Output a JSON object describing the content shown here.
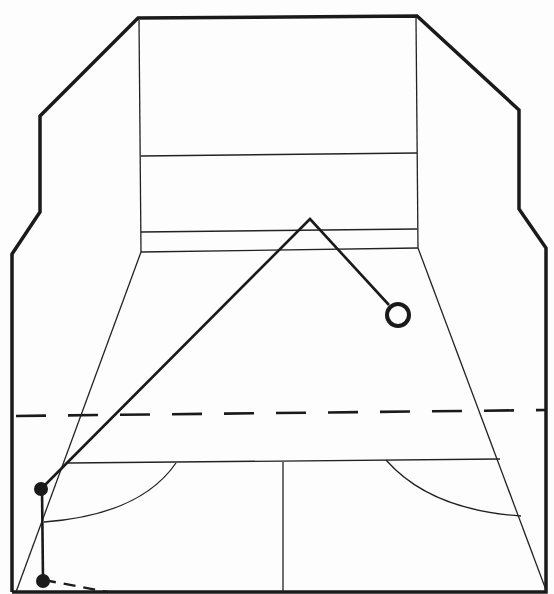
{
  "diagram": {
    "elements": {
      "court_outline": "court-outline",
      "front_wall": "front-wall",
      "service_line": "front-wall-service-line",
      "tin_line": "front-wall-tin-line",
      "short_line": "short-line",
      "half_court_line": "half-court-line",
      "service_boxes": [
        "left-service-box-arc",
        "right-service-box-arc"
      ],
      "reference_line": "dashed-reference-line",
      "shot_path": "ball-trajectory",
      "player_positions": [
        "player-position-start",
        "player-position-end"
      ],
      "ball_landing": "ball-landing-marker"
    },
    "colors": {
      "ink": "#1a1a1a",
      "paper": "#fdfdfd"
    }
  }
}
